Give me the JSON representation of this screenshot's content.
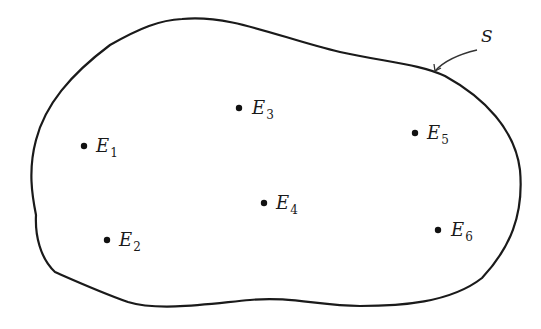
{
  "diagram": {
    "type": "venn-sample-space",
    "set": {
      "label": "S",
      "label_position": {
        "x": 486,
        "y": 37
      },
      "arrow_from": {
        "x": 477,
        "y": 50
      },
      "arrow_to": {
        "x": 435,
        "y": 71
      }
    },
    "points": [
      {
        "id": "E1",
        "base": "E",
        "sub": "1",
        "x": 84,
        "y": 146
      },
      {
        "id": "E2",
        "base": "E",
        "sub": "2",
        "x": 107,
        "y": 240
      },
      {
        "id": "E3",
        "base": "E",
        "sub": "3",
        "x": 239,
        "y": 108
      },
      {
        "id": "E4",
        "base": "E",
        "sub": "4",
        "x": 264,
        "y": 203
      },
      {
        "id": "E5",
        "base": "E",
        "sub": "5",
        "x": 415,
        "y": 133
      },
      {
        "id": "E6",
        "base": "E",
        "sub": "6",
        "x": 438,
        "y": 230
      }
    ],
    "colors": {
      "stroke": "#1a1a1a",
      "background": "#ffffff"
    }
  }
}
